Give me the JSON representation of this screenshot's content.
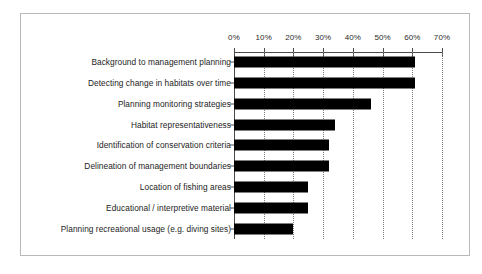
{
  "chart_data": {
    "type": "bar",
    "orientation": "horizontal",
    "title": "",
    "subtitle": "",
    "xlabel": "",
    "ylabel": "",
    "xlim": [
      0,
      70
    ],
    "tick_labels": [
      "0%",
      "10%",
      "20%",
      "30%",
      "40%",
      "50%",
      "60%",
      "70%"
    ],
    "tick_values": [
      0,
      10,
      20,
      30,
      40,
      50,
      60,
      70
    ],
    "grid": true,
    "grid_style": "dotted-vertical",
    "legend": false,
    "value_suffix": "%",
    "bar_color": "#000000",
    "categories": [
      "Background to management planning",
      "Detecting change in habitats over time",
      "Planning monitoring strategies",
      "Habitat representativeness",
      "Identification of conservation criteria",
      "Delineation of management boundaries",
      "Location of fishing areas",
      "Educational / interpretive material",
      "Planning recreational usage (e.g. diving sites)"
    ],
    "values": [
      61,
      61,
      46,
      34,
      32,
      32,
      25,
      25,
      20
    ]
  }
}
